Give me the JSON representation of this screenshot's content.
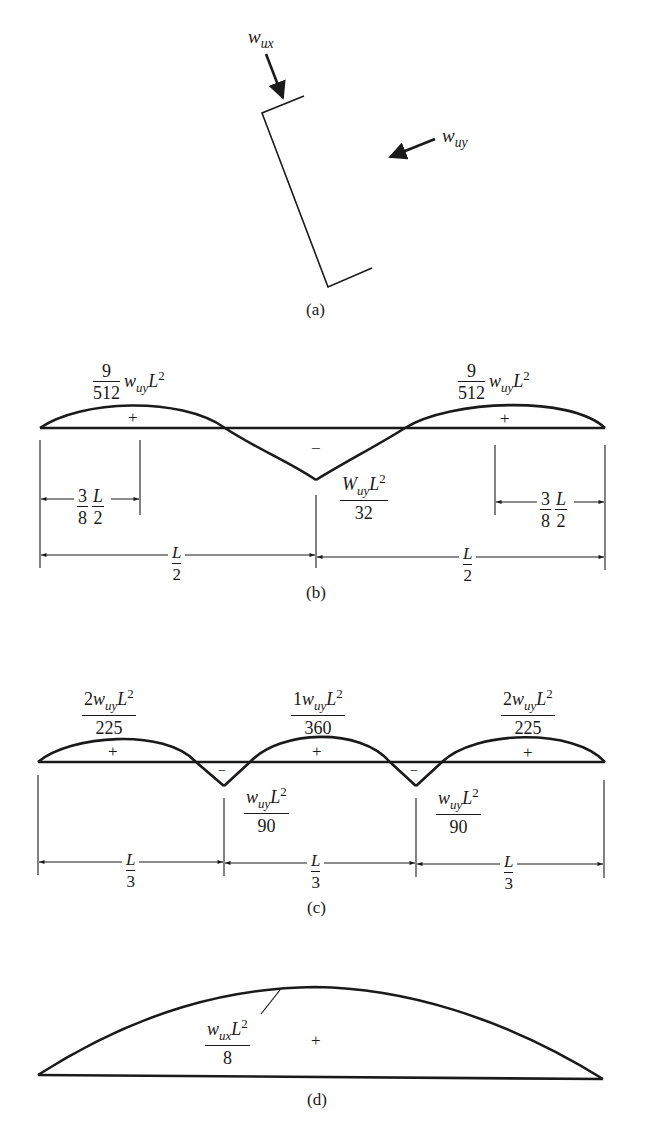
{
  "figure": {
    "panel_a": {
      "caption": "(a)",
      "load_x": {
        "symbol": "w",
        "subscript": "ux"
      },
      "load_y": {
        "symbol": "w",
        "subscript": "uy"
      }
    },
    "panel_b": {
      "caption": "(b)",
      "left_peak": {
        "num": "9",
        "den": "512",
        "tail_symbol": "w",
        "tail_sub": "uy",
        "tail_var": "L",
        "tail_exp": "2"
      },
      "right_peak": {
        "num": "9",
        "den": "512",
        "tail_symbol": "w",
        "tail_sub": "uy",
        "tail_var": "L",
        "tail_exp": "2"
      },
      "center_neg": {
        "symbol": "W",
        "sub": "uy",
        "var": "L",
        "exp": "2",
        "den": "32"
      },
      "plus_sign": "+",
      "minus_sign": "−",
      "left_dim": {
        "coef_num": "3",
        "coef_den": "8",
        "var_num": "L",
        "var_den": "2"
      },
      "right_dim": {
        "coef_num": "3",
        "coef_den": "8",
        "var_num": "L",
        "var_den": "2"
      },
      "half_span_left": {
        "num": "L",
        "den": "2"
      },
      "half_span_right": {
        "num": "L",
        "den": "2"
      }
    },
    "panel_c": {
      "caption": "(c)",
      "left_peak": {
        "coef": "2",
        "symbol": "w",
        "sub": "uy",
        "var": "L",
        "exp": "2",
        "den": "225"
      },
      "mid_peak": {
        "coef": "1",
        "symbol": "w",
        "sub": "uy",
        "var": "L",
        "exp": "2",
        "den": "360"
      },
      "right_peak": {
        "coef": "2",
        "symbol": "w",
        "sub": "uy",
        "var": "L",
        "exp": "2",
        "den": "225"
      },
      "neg_left": {
        "symbol": "w",
        "sub": "uy",
        "var": "L",
        "exp": "2",
        "den": "90"
      },
      "neg_right": {
        "symbol": "w",
        "sub": "uy",
        "var": "L",
        "exp": "2",
        "den": "90"
      },
      "plus_sign": "+",
      "minus_sign": "−",
      "third_spans": [
        {
          "num": "L",
          "den": "3"
        },
        {
          "num": "L",
          "den": "3"
        },
        {
          "num": "L",
          "den": "3"
        }
      ]
    },
    "panel_d": {
      "caption": "(d)",
      "peak": {
        "symbol": "w",
        "sub": "ux",
        "var": "L",
        "exp": "2",
        "den": "8"
      },
      "plus_sign": "+"
    }
  }
}
